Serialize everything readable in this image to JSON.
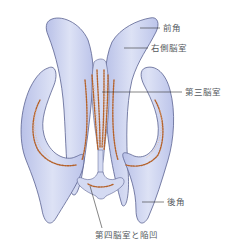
{
  "diagram": {
    "colors": {
      "ventricle_fill": "#c9d0ee",
      "ventricle_fill_light": "#dfe4f6",
      "ventricle_outline": "#5a6290",
      "choroid_plexus": "#b5622a",
      "choroid_plexus_light": "#e8b48a",
      "leader_line": "#333333",
      "label_text": "#555a60"
    },
    "labels": [
      {
        "id": "anterior-horn",
        "text": "前角",
        "x": 163,
        "y": 24
      },
      {
        "id": "right-lateral-ventricle",
        "text": "右側脳室",
        "x": 151,
        "y": 44
      },
      {
        "id": "third-ventricle",
        "text": "第三脳室",
        "x": 185,
        "y": 88
      },
      {
        "id": "posterior-horn",
        "text": "後角",
        "x": 167,
        "y": 198
      },
      {
        "id": "fourth-ventricle-recess",
        "text": "第四脳室と陥凹",
        "x": 95,
        "y": 231
      }
    ]
  }
}
